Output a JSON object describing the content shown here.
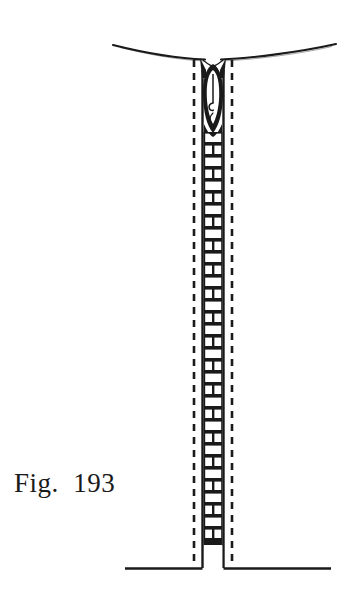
{
  "figure": {
    "caption": "Fig.  193",
    "caption_label": "Fig.",
    "caption_number": "193",
    "background_color": "#ffffff",
    "ink_color": "#1a1a1a",
    "brick_fill_color": "#ffffff",
    "parts": {
      "ground_line": "ground-surface-curve",
      "shaft": "vertical-burrow-shaft",
      "cells": "brick-pattern-cells",
      "larva": "dark-larva-form",
      "funnel": "shaft-entrance-funnel",
      "base_line": "base-ground-line",
      "dashed_walls": "dashed-soil-boundary-lines"
    }
  },
  "geometry": {
    "width": 348,
    "height": 606,
    "ground_curve": {
      "x_start": 113,
      "y_start": 45,
      "x_end": 336,
      "y_end": 44,
      "x_dip": 213,
      "y_dip": 58
    },
    "shaft": {
      "top_y": 58,
      "bottom_y": 568,
      "left_wall_x": 203,
      "right_wall_x": 223,
      "left_dash_x": 194,
      "right_dash_x": 232
    },
    "bricks": {
      "top_y": 132,
      "bottom_y": 545,
      "row_height": 12,
      "rows": 34
    },
    "larva": {
      "top_y": 62,
      "bottom_y": 132,
      "center_x": 213
    },
    "base_line": {
      "x_start": 125,
      "x_end": 331,
      "y": 568,
      "notch_left_x": 203,
      "notch_right_x": 223
    }
  }
}
